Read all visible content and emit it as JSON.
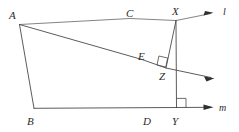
{
  "figure": {
    "points": {
      "A": {
        "label": "A",
        "x": 19,
        "y": 24,
        "label_x": 13,
        "label_y": 15
      },
      "B": {
        "label": "B",
        "x": 34,
        "y": 108,
        "label_x": 31,
        "label_y": 122
      },
      "C": {
        "label": "C",
        "x": 130,
        "y": 14,
        "label_x": 130,
        "label_y": 16
      },
      "D": {
        "label": "D",
        "x": 147,
        "y": 108,
        "label_x": 147,
        "label_y": 122
      },
      "E": {
        "label": "E",
        "x": 142,
        "y": 57,
        "label_x": 142,
        "label_y": 58
      },
      "X": {
        "label": "X",
        "x": 176,
        "y": 20,
        "label_x": 177,
        "label_y": 13
      },
      "Y": {
        "label": "Y",
        "x": 176,
        "y": 108,
        "label_x": 177,
        "label_y": 122
      },
      "Z": {
        "label": "Z",
        "x": 166,
        "y": 68,
        "label_x": 162,
        "label_y": 80
      }
    },
    "lines": {
      "l": {
        "label": "l",
        "label_x": 223,
        "label_y": 12
      },
      "m": {
        "label": "m",
        "label_x": 222,
        "label_y": 111
      }
    },
    "right_angles": [
      {
        "name": "right-angle-at-z",
        "vertex": "Z"
      },
      {
        "name": "right-angle-at-y",
        "vertex": "Y"
      }
    ],
    "colors": {
      "stroke": "#4a4a4a",
      "stroke_light": "#6e6e6e",
      "label": "#2b2b2b",
      "background": "#ffffff"
    }
  }
}
